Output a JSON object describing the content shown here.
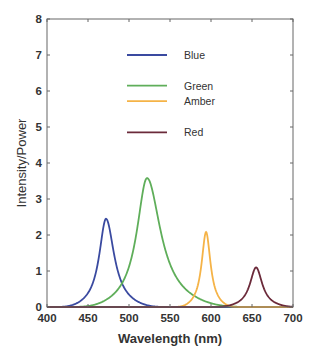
{
  "chart_data": {
    "type": "line",
    "title": "",
    "xlabel": "Wavelength (nm)",
    "ylabel": "Intensity/Power",
    "xlim": [
      400,
      700
    ],
    "ylim": [
      0,
      8
    ],
    "xticks": [
      400,
      450,
      500,
      550,
      600,
      650,
      700
    ],
    "yticks": [
      0,
      1,
      2,
      3,
      4,
      5,
      6,
      7,
      8
    ],
    "grid": false,
    "legend_position": "upper-center-inside",
    "series": [
      {
        "name": "Blue",
        "color": "#3a4aa0",
        "peak_nm": 472,
        "peak_value": 2.45,
        "hw_left": 10,
        "hw_right": 12,
        "legend_y": 7.0
      },
      {
        "name": "Green",
        "color": "#5fae5a",
        "peak_nm": 522,
        "peak_value": 3.58,
        "hw_left": 15,
        "hw_right": 20,
        "legend_y": 6.15
      },
      {
        "name": "Amber",
        "color": "#f5b347",
        "peak_nm": 594,
        "peak_value": 2.08,
        "hw_left": 6.5,
        "hw_right": 6.5,
        "legend_y": 5.72
      },
      {
        "name": "Red",
        "color": "#6b2a3a",
        "peak_nm": 655,
        "peak_value": 1.1,
        "hw_left": 9,
        "hw_right": 9,
        "legend_y": 4.85
      }
    ]
  }
}
